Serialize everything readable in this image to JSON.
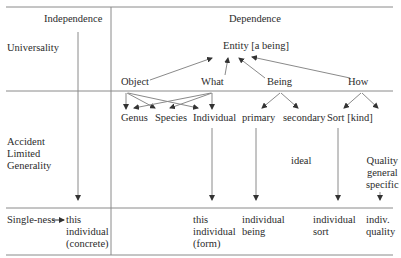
{
  "columns": {
    "independence": "Independence",
    "dependence": "Dependence"
  },
  "rows": {
    "universality": "Universality",
    "accident": "Accident\nLimited\nGenerality",
    "singleness": "Single-ness"
  },
  "nodes": {
    "entity": "Entity [a being]",
    "object": "Object",
    "what": "What",
    "being": "Being",
    "how": "How",
    "genus": "Genus",
    "species": "Species",
    "individual": "Individual",
    "primary": "primary",
    "secondary": "secondary",
    "sort": "Sort [kind]",
    "ideal": "ideal",
    "quality": "Quality\ngeneral\nspecific"
  },
  "outcomes": {
    "concrete": "this\nindividual\n(concrete)",
    "form": "this\nindividual\n(form)",
    "being": "individual\nbeing",
    "sort": "individual\nsort",
    "quality": "indiv.\nquality"
  },
  "colors": {
    "line": "#8a8a8a",
    "arrow": "#333333",
    "text": "#2b2b2b"
  }
}
